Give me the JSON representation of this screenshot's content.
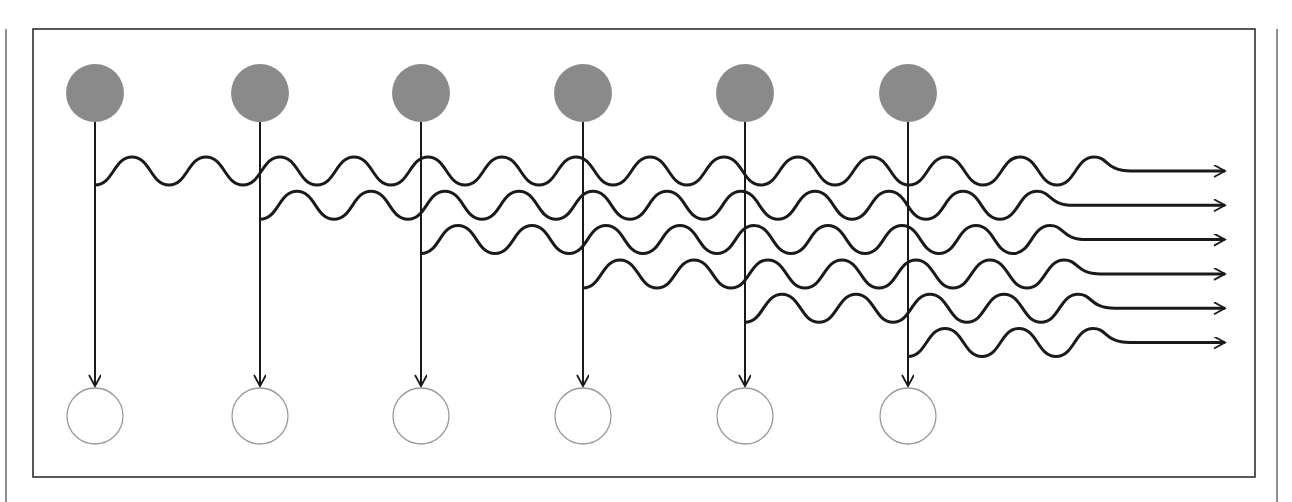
{
  "diagram": {
    "colors": {
      "filled_node": "#8a8a8a",
      "hollow_node_stroke": "#9a9a9a",
      "line": "#1a1a1a",
      "frame": "#222222"
    },
    "frame": {
      "x": 33,
      "y": 29,
      "width": 1222,
      "height": 448
    },
    "outer_lines": {
      "left_x": 6,
      "right_x": 1277,
      "top": 29,
      "bottom": 502
    },
    "columns_x": [
      95,
      260,
      421,
      583,
      745,
      908
    ],
    "filled_nodes": {
      "y": 93,
      "r": 29
    },
    "hollow_nodes": {
      "y": 416,
      "r": 28
    },
    "arrow_tip_y": 386,
    "waves": {
      "start_trough_y": 185,
      "row_spacing": 34.3,
      "period": 74,
      "amplitude": 14,
      "straight_end_x": 1120,
      "arrow_tip_x": 1225
    }
  }
}
